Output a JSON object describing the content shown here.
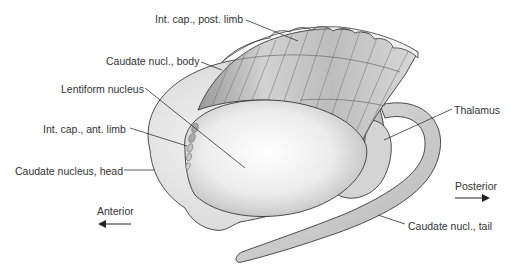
{
  "diagram": {
    "type": "anatomical-illustration",
    "labels": [
      {
        "id": "int-cap-post-limb",
        "text": "Int. cap., post. limb",
        "x": 155,
        "y": 13
      },
      {
        "id": "caudate-nucl-body",
        "text": "Caudate nucl., body",
        "x": 106,
        "y": 55
      },
      {
        "id": "lentiform-nucleus",
        "text": "Lentiform nucleus",
        "x": 61,
        "y": 83
      },
      {
        "id": "int-cap-ant-limb",
        "text": "Int. cap., ant. limb",
        "x": 43,
        "y": 123
      },
      {
        "id": "caudate-nucleus-head",
        "text": "Caudate nucleus, head",
        "x": 15,
        "y": 165
      },
      {
        "id": "thalamus",
        "text": "Thalamus",
        "x": 454,
        "y": 104
      },
      {
        "id": "caudate-nucl-tail",
        "text": "Caudate nucl., tail",
        "x": 408,
        "y": 220
      }
    ],
    "orientation": {
      "anterior": {
        "text": "Anterior",
        "x": 97,
        "y": 205,
        "arrow": "left"
      },
      "posterior": {
        "text": "Posterior",
        "x": 455,
        "y": 180,
        "arrow": "right"
      }
    },
    "colors": {
      "outline": "#3a3a3a",
      "structure_fill": "#e6e6e6",
      "shadow": "#bdbdbd",
      "label_text": "#333333",
      "background": "#ffffff"
    }
  }
}
